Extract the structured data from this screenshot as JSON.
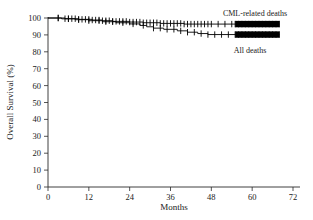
{
  "chart_data": {
    "type": "line",
    "title": "",
    "subtitle": "",
    "xlabel": "Months",
    "ylabel": "Overall Survival (%)",
    "xlim": [
      0,
      72
    ],
    "ylim": [
      0,
      100
    ],
    "xticks": [
      0,
      12,
      24,
      36,
      48,
      60,
      72
    ],
    "yticks": [
      0,
      10,
      20,
      30,
      40,
      50,
      60,
      70,
      80,
      90,
      100
    ],
    "xtick_labels": [
      "0",
      "12",
      "24",
      "36",
      "48",
      "60",
      "72"
    ],
    "ytick_labels": [
      "0",
      "10",
      "20",
      "30",
      "40",
      "50",
      "60",
      "70",
      "80",
      "90",
      "100"
    ],
    "grid": false,
    "legend_position": "inline-right",
    "plot_kind": "kaplan-meier",
    "annotations": [
      {
        "text": "CML-related deaths",
        "x": 60,
        "y": 99.5
      },
      {
        "text": "All deaths",
        "x": 58,
        "y": 85.5
      }
    ],
    "series": [
      {
        "name": "CML-related deaths",
        "label": "CML-related deaths",
        "color": "#000000",
        "steps": [
          [
            0,
            100
          ],
          [
            5,
            100
          ],
          [
            5,
            99.6
          ],
          [
            9,
            99.6
          ],
          [
            9,
            99.2
          ],
          [
            13,
            99.2
          ],
          [
            13,
            98.8
          ],
          [
            16,
            98.8
          ],
          [
            16,
            98.4
          ],
          [
            19,
            98.4
          ],
          [
            19,
            98.0
          ],
          [
            24,
            98.0
          ],
          [
            24,
            97.6
          ],
          [
            28,
            97.6
          ],
          [
            28,
            97.2
          ],
          [
            33,
            97.2
          ],
          [
            33,
            96.8
          ],
          [
            40,
            96.8
          ],
          [
            40,
            96.4
          ],
          [
            68,
            96.4
          ]
        ],
        "censor_x": [
          3,
          5,
          6,
          7,
          8,
          9,
          10,
          11,
          12,
          13,
          14,
          15,
          16,
          17,
          18,
          19,
          20,
          21,
          22,
          23,
          24,
          25,
          26,
          27,
          28,
          29,
          30,
          31,
          32,
          33,
          34,
          35,
          36,
          37,
          38,
          39,
          40,
          41,
          42,
          43,
          44,
          45,
          46,
          47,
          48,
          50,
          52,
          54,
          55,
          56,
          57,
          58,
          59,
          60,
          61,
          62,
          63,
          64,
          65,
          66,
          67,
          68
        ],
        "censor_y": 96.4
      },
      {
        "name": "All deaths",
        "label": "All deaths",
        "color": "#000000",
        "steps": [
          [
            0,
            100
          ],
          [
            4,
            100
          ],
          [
            4,
            99.5
          ],
          [
            8,
            99.5
          ],
          [
            8,
            99.0
          ],
          [
            12,
            99.0
          ],
          [
            12,
            98.4
          ],
          [
            16,
            98.4
          ],
          [
            16,
            97.8
          ],
          [
            20,
            97.8
          ],
          [
            20,
            97.2
          ],
          [
            24,
            97.2
          ],
          [
            24,
            96.5
          ],
          [
            27,
            96.5
          ],
          [
            27,
            95.6
          ],
          [
            29,
            95.6
          ],
          [
            29,
            94.8
          ],
          [
            31,
            94.8
          ],
          [
            31,
            94.0
          ],
          [
            34,
            94.0
          ],
          [
            34,
            93.3
          ],
          [
            38,
            93.3
          ],
          [
            38,
            92.4
          ],
          [
            41,
            92.4
          ],
          [
            41,
            91.6
          ],
          [
            44,
            91.6
          ],
          [
            44,
            90.8
          ],
          [
            47,
            90.8
          ],
          [
            47,
            90.2
          ],
          [
            68,
            90.2
          ]
        ],
        "censor_x": [
          3,
          6,
          9,
          12,
          15,
          17,
          19,
          22,
          25,
          28,
          31,
          33,
          35,
          37,
          39,
          41,
          43,
          45,
          47,
          49,
          51,
          53,
          55,
          56,
          57,
          58,
          59,
          60,
          61,
          62,
          63,
          64,
          65,
          66,
          67,
          68
        ],
        "censor_y": 90.2
      }
    ]
  },
  "axes": {
    "y_title": "Overall Survival (%)",
    "x_title": "Months"
  },
  "legend": {
    "cml_label": "CML-related deaths",
    "all_label": "All deaths"
  },
  "colors": {
    "curve": "#000000",
    "axis": "#2a2a2a",
    "text": "#1a1a1a",
    "background": "#ffffff"
  }
}
